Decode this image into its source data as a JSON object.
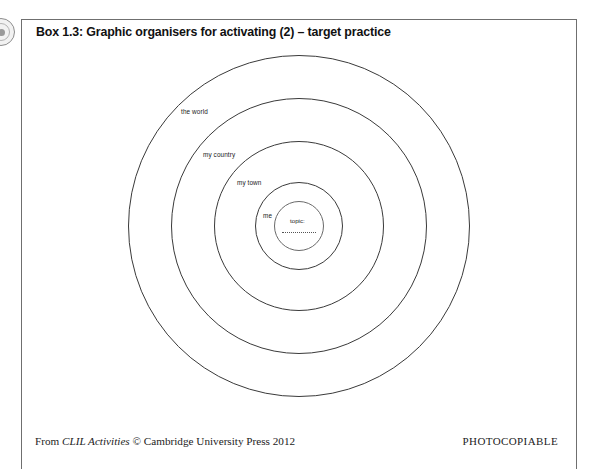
{
  "page": {
    "background_color": "#ffffff",
    "border_color": "#6f6f6f"
  },
  "binding": {
    "icon_name": "spiral-binding-disc"
  },
  "box": {
    "title": "Box 1.3: Graphic organisers for activating (2) – target practice"
  },
  "diagram": {
    "type": "concentric-target",
    "center": {
      "x": 298,
      "y": 225
    },
    "rings": [
      {
        "label": "the world",
        "radius": 171,
        "label_x": 180,
        "label_y": 107
      },
      {
        "label": "my country",
        "radius": 128,
        "label_x": 202,
        "label_y": 150
      },
      {
        "label": "my town",
        "radius": 85,
        "label_x": 236,
        "label_y": 178
      },
      {
        "label": "me",
        "radius": 44,
        "label_x": 262,
        "label_y": 211
      },
      {
        "label": "",
        "radius": 25,
        "label_x": 0,
        "label_y": 0
      }
    ],
    "center_field": {
      "label": "topic:",
      "has_dotted_rule": true
    }
  },
  "footer": {
    "prefix": "From ",
    "title_italic": "CLIL Activities",
    "suffix": " © Cambridge University Press 2012",
    "photocopiable": "PHOTOCOPIABLE"
  }
}
